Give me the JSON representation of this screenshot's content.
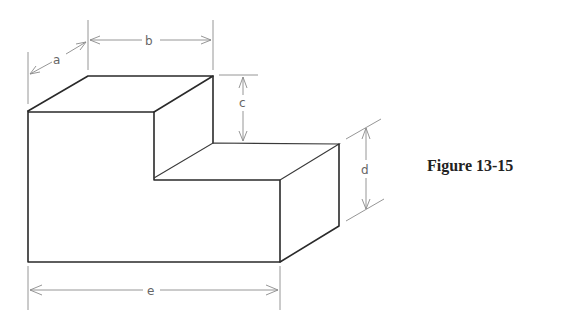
{
  "figure": {
    "caption": "Figure 13-15",
    "dimensions": [
      {
        "label": "a",
        "meaning": "depth"
      },
      {
        "label": "b",
        "meaning": "width of upper step"
      },
      {
        "label": "c",
        "meaning": "height of upper step above lower step"
      },
      {
        "label": "d",
        "meaning": "height of lower step"
      },
      {
        "label": "e",
        "meaning": "overall width"
      }
    ]
  },
  "colors": {
    "edge": "#2a2a2a",
    "dimension": "#8a8a8a",
    "background": "#ffffff"
  }
}
